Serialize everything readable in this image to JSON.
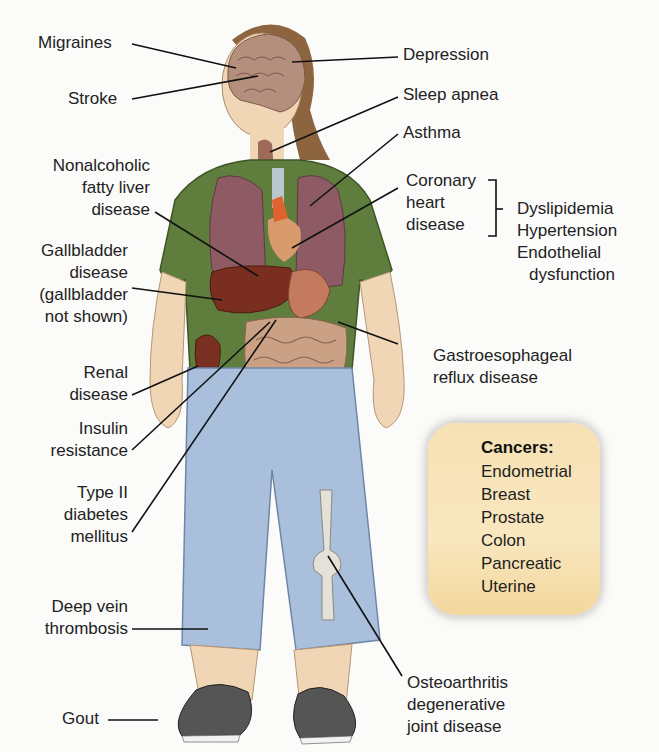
{
  "figure": {
    "colors": {
      "background": "#fbfbfa",
      "shirt": "#5f7d3c",
      "shorts": "#a9bfdc",
      "skin": "#f1d6b5",
      "hair": "#8c6540",
      "lungs": "#8e5a63",
      "liver": "#7a2e1f",
      "intestine": "#caa184",
      "shoes": "#555555",
      "cancer_box": "#f7e3b6",
      "leader_line": "#111111"
    }
  },
  "labels_left": {
    "migraines": "Migraines",
    "stroke": "Stroke",
    "nafld": [
      "Nonalcoholic",
      "fatty liver",
      "disease"
    ],
    "gallbladder": [
      "Gallbladder",
      "disease",
      "(gallbladder",
      "not shown)"
    ],
    "renal": [
      "Renal",
      "disease"
    ],
    "insulin": [
      "Insulin",
      "resistance"
    ],
    "diabetes": [
      "Type II",
      "diabetes",
      "mellitus"
    ],
    "dvt": [
      "Deep vein",
      "thrombosis"
    ],
    "gout": "Gout"
  },
  "labels_right": {
    "depression": "Depression",
    "sleep_apnea": "Sleep apnea",
    "asthma": "Asthma",
    "chd": [
      "Coronary",
      "heart",
      "disease"
    ],
    "chd_factors": [
      "Dyslipidemia",
      "Hypertension",
      "Endothelial",
      "dysfunction"
    ],
    "gerd": [
      "Gastroesophageal",
      "reflux disease"
    ],
    "osteoarthritis": [
      "Osteoarthritis",
      "degenerative",
      "joint disease"
    ]
  },
  "cancers": {
    "title": "Cancers:",
    "items": [
      "Endometrial",
      "Breast",
      "Prostate",
      "Colon",
      "Pancreatic",
      "Uterine"
    ]
  }
}
